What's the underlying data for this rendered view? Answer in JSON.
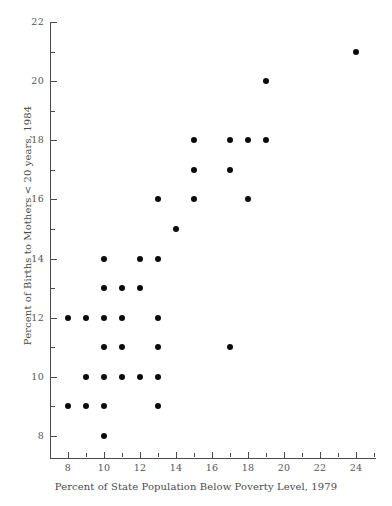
{
  "chart_data": {
    "type": "scatter",
    "title": "",
    "xlabel": "Percent of State Population Below Poverty Level, 1979",
    "ylabel": "Percent of Births to Mothers < 20 years, 1984",
    "xlim": [
      7.0,
      25.1
    ],
    "ylim": [
      7.1,
      22.0
    ],
    "grid": false,
    "legend": null,
    "x_ticks_major": [
      8,
      10,
      12,
      14,
      16,
      18,
      20,
      22,
      24
    ],
    "x_ticks_minor": [
      9,
      11,
      13,
      15,
      17,
      19,
      21,
      23,
      25
    ],
    "y_ticks_major": [
      8,
      10,
      12,
      14,
      16,
      18,
      20,
      22
    ],
    "y_ticks_minor": [
      9,
      11,
      13,
      15,
      17,
      19,
      21
    ],
    "marker": "filled-circle",
    "marker_color": "#0b0b0b",
    "axis_color": "#4a4a4a",
    "background_color": "#ffffff",
    "points": [
      {
        "x": 24,
        "y": 21
      },
      {
        "x": 19,
        "y": 20
      },
      {
        "x": 15,
        "y": 18
      },
      {
        "x": 17,
        "y": 18
      },
      {
        "x": 18,
        "y": 18
      },
      {
        "x": 19,
        "y": 18
      },
      {
        "x": 15,
        "y": 17
      },
      {
        "x": 17,
        "y": 17
      },
      {
        "x": 13,
        "y": 16
      },
      {
        "x": 15,
        "y": 16
      },
      {
        "x": 18,
        "y": 16
      },
      {
        "x": 14,
        "y": 15
      },
      {
        "x": 10,
        "y": 14
      },
      {
        "x": 12,
        "y": 14
      },
      {
        "x": 13,
        "y": 14
      },
      {
        "x": 10,
        "y": 13
      },
      {
        "x": 11,
        "y": 13
      },
      {
        "x": 12,
        "y": 13
      },
      {
        "x": 8,
        "y": 12
      },
      {
        "x": 9,
        "y": 12
      },
      {
        "x": 10,
        "y": 12
      },
      {
        "x": 11,
        "y": 12
      },
      {
        "x": 13,
        "y": 12
      },
      {
        "x": 10,
        "y": 11
      },
      {
        "x": 11,
        "y": 11
      },
      {
        "x": 13,
        "y": 11
      },
      {
        "x": 17,
        "y": 11
      },
      {
        "x": 9,
        "y": 10
      },
      {
        "x": 10,
        "y": 10
      },
      {
        "x": 11,
        "y": 10
      },
      {
        "x": 12,
        "y": 10
      },
      {
        "x": 13,
        "y": 10
      },
      {
        "x": 8,
        "y": 9
      },
      {
        "x": 9,
        "y": 9
      },
      {
        "x": 10,
        "y": 9
      },
      {
        "x": 13,
        "y": 9
      },
      {
        "x": 10,
        "y": 8
      }
    ]
  }
}
